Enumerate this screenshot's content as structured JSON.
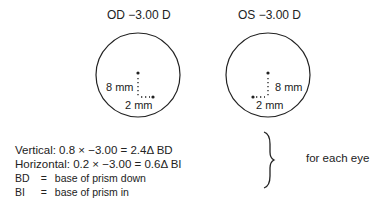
{
  "lenses": [
    {
      "title": "OD −3.00 D",
      "vertical_label": "8 mm",
      "horizontal_label": "2 mm"
    },
    {
      "title": "OS −3.00 D",
      "vertical_label": "8 mm",
      "horizontal_label": "2 mm"
    }
  ],
  "equations": {
    "vertical": "Vertical: 0.8 × −3.00 = 2.4Δ BD",
    "horizontal": "Horizontal: 0.2 × −3.00 = 0.6Δ BI"
  },
  "definitions": [
    {
      "abbr": "BD",
      "eq": "=",
      "meaning": "base of prism down"
    },
    {
      "abbr": "BI",
      "eq": "=",
      "meaning": "base of prism in"
    }
  ],
  "brace_note": "for each eye"
}
